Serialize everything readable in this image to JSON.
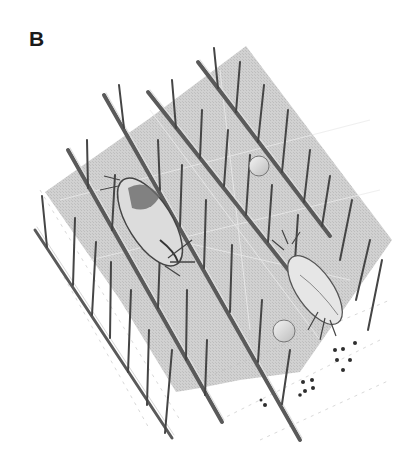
{
  "figure": {
    "panel_label": "B",
    "background": "#ffffff",
    "plane_color": "#c8c8c8",
    "plane_highlight": "#e2e2e2",
    "branch_color": "#555555",
    "spine_color": "#3c3c3c",
    "dot_color": "#2a2a2a",
    "elements": {
      "branches": 5,
      "insects": 2,
      "spheres": 2,
      "dots": 13
    }
  }
}
